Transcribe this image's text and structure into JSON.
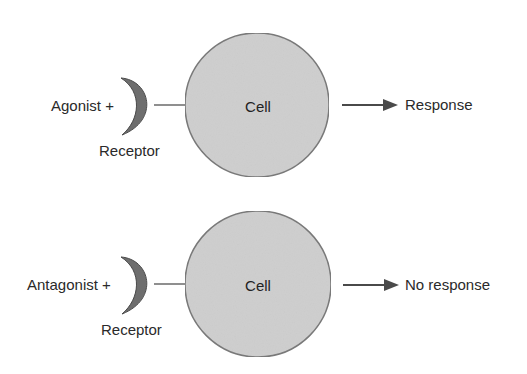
{
  "panels": [
    {
      "ligand_label": "Agonist +",
      "receptor_label": "Receptor",
      "cell_label": "Cell",
      "outcome_label": "Response"
    },
    {
      "ligand_label": "Antagonist +",
      "receptor_label": "Receptor",
      "cell_label": "Cell",
      "outcome_label": "No response"
    }
  ],
  "colors": {
    "cell_fill": "#cfcfcf",
    "cell_stroke": "#7a7a7a",
    "receptor_fill": "#6e6e6e",
    "receptor_stroke": "#4a4a4a",
    "line": "#6a6a6a",
    "arrow": "#4a4a4a"
  }
}
